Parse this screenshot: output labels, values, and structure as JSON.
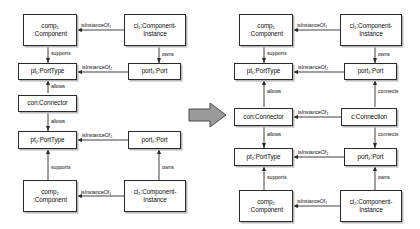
{
  "figure": {
    "type": "uml-object-diagram-pair",
    "transform_arrow": "block-arrow-right",
    "colors": {
      "box_fill": "#ffffff",
      "box_border": "#2b2b2b",
      "box_shadow": "#b9b9b9",
      "edge": "#2b2b2b",
      "text": "#111111",
      "transform_arrow_fill": "#9a9a9a",
      "transform_arrow_border": "#4a4a4a",
      "background": "#ffffff"
    }
  },
  "left_diagram": {
    "name": "before",
    "nodes": [
      {
        "id": "comp1",
        "label": "comp₁\n:Component"
      },
      {
        "id": "ci1",
        "label": "ci₁:Component-\nInstance"
      },
      {
        "id": "pt1",
        "label": "pt₁:PortType"
      },
      {
        "id": "port1",
        "label": "port₁:Port"
      },
      {
        "id": "con",
        "label": "con:Connector"
      },
      {
        "id": "pt2",
        "label": "pt₂:PortType"
      },
      {
        "id": "port2",
        "label": "port₂:Port"
      },
      {
        "id": "comp2",
        "label": "comp₂\n:Component"
      },
      {
        "id": "ci2",
        "label": "ci₂:Component-\nInstance"
      }
    ],
    "edges": [
      {
        "from": "ci1",
        "to": "comp1",
        "label": "isInstanceOf₁"
      },
      {
        "from": "comp1",
        "to": "pt1",
        "label": "supports"
      },
      {
        "from": "ci1",
        "to": "port1",
        "label": "owns"
      },
      {
        "from": "port1",
        "to": "pt1",
        "label": "isInstanceOf₂"
      },
      {
        "from": "con",
        "to": "pt1",
        "label": "allows"
      },
      {
        "from": "con",
        "to": "pt2",
        "label": "allows"
      },
      {
        "from": "port2",
        "to": "pt2",
        "label": "isInstanceOf₂"
      },
      {
        "from": "comp2",
        "to": "pt2",
        "label": "supports"
      },
      {
        "from": "ci2",
        "to": "port2",
        "label": "owns"
      },
      {
        "from": "ci2",
        "to": "comp2",
        "label": "isInstanceOf₁"
      }
    ]
  },
  "right_diagram": {
    "name": "after",
    "nodes": [
      {
        "id": "comp1",
        "label": "comp₁\n:Component"
      },
      {
        "id": "ci1",
        "label": "ci₁:Component-\nInstance"
      },
      {
        "id": "pt1",
        "label": "pt₁:PortType"
      },
      {
        "id": "port1",
        "label": "port₁:Port"
      },
      {
        "id": "con",
        "label": "con:Connector"
      },
      {
        "id": "conn",
        "label": "c:Connection"
      },
      {
        "id": "pt2",
        "label": "pt₂:PortType"
      },
      {
        "id": "port2",
        "label": "port₂:Port"
      },
      {
        "id": "comp2",
        "label": "comp₂\n:Component"
      },
      {
        "id": "ci2",
        "label": "ci₂:Component-\nInstance"
      }
    ],
    "edges": [
      {
        "from": "ci1",
        "to": "comp1",
        "label": "isInstanceOf₁"
      },
      {
        "from": "comp1",
        "to": "pt1",
        "label": "supports"
      },
      {
        "from": "ci1",
        "to": "port1",
        "label": "owns"
      },
      {
        "from": "port1",
        "to": "pt1",
        "label": "isInstanceOf₂"
      },
      {
        "from": "con",
        "to": "pt1",
        "label": "allows"
      },
      {
        "from": "conn",
        "to": "port1",
        "label": "connects"
      },
      {
        "from": "conn",
        "to": "con",
        "label": "isInstanceOf₃"
      },
      {
        "from": "conn",
        "to": "port2",
        "label": "connects"
      },
      {
        "from": "con",
        "to": "pt2",
        "label": "allows"
      },
      {
        "from": "port2",
        "to": "pt2",
        "label": "isInstanceOf₂"
      },
      {
        "from": "comp2",
        "to": "pt2",
        "label": "supports"
      },
      {
        "from": "ci2",
        "to": "port2",
        "label": "owns"
      },
      {
        "from": "ci2",
        "to": "comp2",
        "label": "isInstanceOf₁"
      }
    ]
  },
  "labels": {
    "comp1": "comp₁\n:Component",
    "ci1": "ci₁:Component-\nInstance",
    "pt1": "pt₁:PortType",
    "port1": "port₁:Port",
    "con": "con:Connector",
    "conn": "c:Connection",
    "pt2": "pt₂:PortType",
    "port2": "port₂:Port",
    "comp2": "comp₂\n:Component",
    "ci2": "ci₂:Component-\nInstance",
    "isInstanceOf1": "isInstanceOf₁",
    "isInstanceOf2": "isInstanceOf₂",
    "isInstanceOf3": "isInstanceOf₃",
    "supports": "supports",
    "owns": "owns",
    "allows": "allows",
    "connects": "connects"
  }
}
